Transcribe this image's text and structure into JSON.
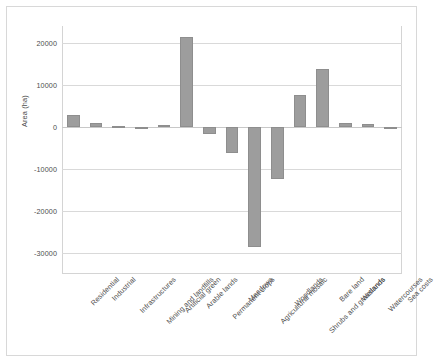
{
  "chart_data": {
    "type": "bar",
    "title": "",
    "xlabel": "",
    "ylabel": "Area (ha)",
    "ylim": [
      -35000,
      24000
    ],
    "yticks": [
      20000,
      10000,
      0,
      -10000,
      -20000,
      -30000
    ],
    "ytick_labels": [
      "20000",
      "10000",
      "0",
      "-10000",
      "-20000",
      "-30000"
    ],
    "grid": true,
    "legend": "none",
    "bar_color": "#9d9d9d",
    "categories": [
      "Residential",
      "Industrial",
      "Infrastructures",
      "Mining and landfills",
      "Artificial green",
      "Arable lands",
      "Permanent crops",
      "Meadows",
      "Agricultural mosaic",
      "Woodlands",
      "Shrubs and grasslands",
      "Bare land",
      "Wetlands",
      "Watercourses",
      "Sea costs"
    ],
    "values": [
      2800,
      900,
      300,
      -400,
      400,
      21500,
      -1700,
      -6200,
      -28500,
      -12500,
      7600,
      13800,
      900,
      800,
      -300
    ]
  }
}
